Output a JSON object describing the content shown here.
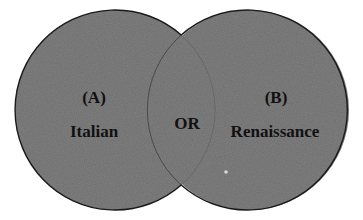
{
  "diagram": {
    "type": "venn",
    "background": "#ffffff",
    "fill_color": "#6e6e6e",
    "stroke_color": "#1a1a1a",
    "text_color": "#111111",
    "sets": [
      {
        "id": "A",
        "tag": "(A)",
        "label": "Italian"
      },
      {
        "id": "B",
        "tag": "(B)",
        "label": "Renaissance"
      }
    ],
    "overlap_label": "OR"
  }
}
